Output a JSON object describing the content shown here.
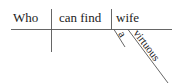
{
  "diagram": {
    "type": "sentence-diagram",
    "subject": "Who",
    "verb": "can find",
    "object": "wife",
    "modifiers": [
      {
        "word": "a",
        "modifies": "wife"
      },
      {
        "word": "virtuous",
        "modifies": "wife"
      }
    ]
  }
}
